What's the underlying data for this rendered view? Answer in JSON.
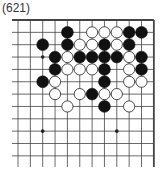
{
  "title": "(621)",
  "board": {
    "origin_x": 18,
    "origin_y": 20,
    "spacing": 12.35,
    "cols": 12,
    "rows": 12,
    "line_color": "#444444",
    "edge_top": true,
    "edge_right": true,
    "star_points": [
      [
        2,
        3
      ],
      [
        2,
        9
      ],
      [
        8,
        9
      ]
    ]
  },
  "stones": {
    "black": [
      [
        4,
        1
      ],
      [
        9,
        1
      ],
      [
        10,
        1
      ],
      [
        2,
        2
      ],
      [
        4,
        2
      ],
      [
        7,
        2
      ],
      [
        9,
        2
      ],
      [
        3,
        3
      ],
      [
        5,
        3
      ],
      [
        6,
        3
      ],
      [
        7,
        3
      ],
      [
        8,
        3
      ],
      [
        10,
        3
      ],
      [
        3,
        4
      ],
      [
        7,
        4
      ],
      [
        10,
        4
      ],
      [
        2,
        5
      ],
      [
        7,
        5
      ],
      [
        6,
        6
      ],
      [
        7,
        7
      ]
    ],
    "white": [
      [
        6,
        1
      ],
      [
        7,
        1
      ],
      [
        8,
        1
      ],
      [
        5,
        2
      ],
      [
        6,
        2
      ],
      [
        8,
        2
      ],
      [
        4,
        3
      ],
      [
        9,
        3
      ],
      [
        4,
        4
      ],
      [
        5,
        4
      ],
      [
        6,
        4
      ],
      [
        9,
        4
      ],
      [
        3,
        5
      ],
      [
        9,
        5
      ],
      [
        10,
        5
      ],
      [
        3,
        6
      ],
      [
        5,
        6
      ],
      [
        7,
        6
      ],
      [
        8,
        6
      ],
      [
        4,
        7
      ],
      [
        9,
        7
      ]
    ]
  }
}
